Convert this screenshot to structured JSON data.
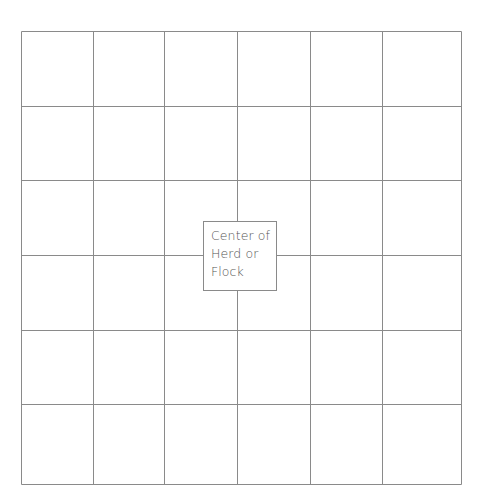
{
  "diagram": {
    "type": "grid",
    "rows": 6,
    "columns": 6,
    "line_color": "#8a8a8a",
    "x_lines": [
      21,
      93,
      164,
      237,
      310,
      382,
      461
    ],
    "y_lines": [
      31,
      106,
      180,
      255,
      330,
      404,
      484
    ],
    "center_label": {
      "lines": [
        "Center of",
        "Herd or",
        "Flock"
      ]
    }
  }
}
